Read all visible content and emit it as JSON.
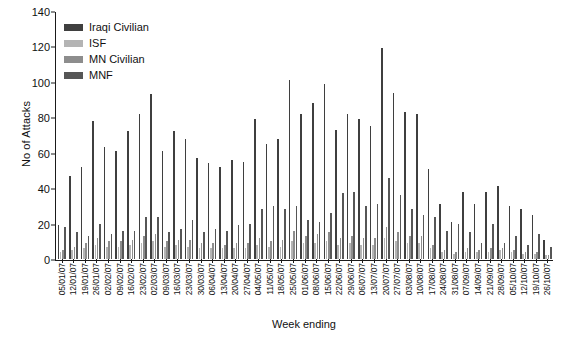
{
  "chart_data": {
    "type": "bar",
    "title": "",
    "xlabel": "Week ending",
    "ylabel": "No of Attacks",
    "ylim": [
      0,
      140
    ],
    "yticks": [
      0,
      20,
      40,
      60,
      80,
      100,
      120,
      140
    ],
    "grid": false,
    "legend_position": "top-left",
    "categories": [
      "05/01/07",
      "12/01/07",
      "19/01/07",
      "26/01/07",
      "02/02/07",
      "09/02/07",
      "16/02/07",
      "23/02/07",
      "02/03/07",
      "09/03/07",
      "16/03/07",
      "23/03/07",
      "30/03/07",
      "06/04/07",
      "13/04/07",
      "20/04/07",
      "27/04/07",
      "04/05/07",
      "11/05/07",
      "18/05/07",
      "25/05/07",
      "01/06/07",
      "08/06/07",
      "15/06/07",
      "22/06/07",
      "29/06/07",
      "06/07/07",
      "13/07/07",
      "20/07/07",
      "27/07/07",
      "03/08/07",
      "10/08/07",
      "17/08/07",
      "24/08/07",
      "31/08/07",
      "07/09/07",
      "14/09/07",
      "21/09/07",
      "28/09/07",
      "05/10/07",
      "12/10/07",
      "19/10/07",
      "26/10/07"
    ],
    "series": [
      {
        "name": "Iraqi Civilian",
        "color": "#3f3f3f",
        "values": [
          19,
          47,
          52,
          78,
          63,
          61,
          72,
          82,
          93,
          61,
          72,
          68,
          57,
          54,
          52,
          56,
          55,
          79,
          65,
          68,
          101,
          82,
          88,
          99,
          73,
          82,
          79,
          75,
          119,
          94,
          83,
          82,
          51,
          31,
          21,
          38,
          31,
          38,
          41,
          30,
          28,
          25,
          11
        ]
      },
      {
        "name": "ISF",
        "color": "#b4b4b4",
        "values": [
          4,
          5,
          6,
          8,
          7,
          7,
          8,
          9,
          10,
          7,
          8,
          7,
          6,
          6,
          6,
          6,
          6,
          8,
          7,
          7,
          10,
          9,
          9,
          10,
          8,
          9,
          8,
          8,
          12,
          10,
          9,
          9,
          6,
          4,
          3,
          4,
          4,
          4,
          5,
          4,
          3,
          3,
          2
        ]
      },
      {
        "name": "MN Civilian",
        "color": "#8d8d8d",
        "values": [
          5,
          7,
          9,
          12,
          10,
          10,
          11,
          13,
          14,
          10,
          11,
          11,
          9,
          9,
          8,
          9,
          9,
          12,
          10,
          11,
          16,
          13,
          14,
          15,
          12,
          13,
          12,
          12,
          18,
          15,
          13,
          13,
          8,
          5,
          4,
          6,
          5,
          6,
          6,
          5,
          4,
          4,
          2
        ]
      },
      {
        "name": "MNF",
        "color": "#565656",
        "values": [
          18,
          15,
          13,
          20,
          14,
          16,
          16,
          24,
          24,
          15,
          17,
          22,
          15,
          17,
          16,
          19,
          20,
          28,
          30,
          28,
          30,
          22,
          21,
          26,
          37,
          38,
          30,
          31,
          46,
          36,
          28,
          25,
          24,
          16,
          20,
          15,
          9,
          20,
          9,
          13,
          8,
          14,
          7
        ]
      }
    ]
  },
  "legend": {
    "items": [
      {
        "label": "Iraqi Civilian"
      },
      {
        "label": "ISF"
      },
      {
        "label": "MN Civilian"
      },
      {
        "label": "MNF"
      }
    ]
  }
}
